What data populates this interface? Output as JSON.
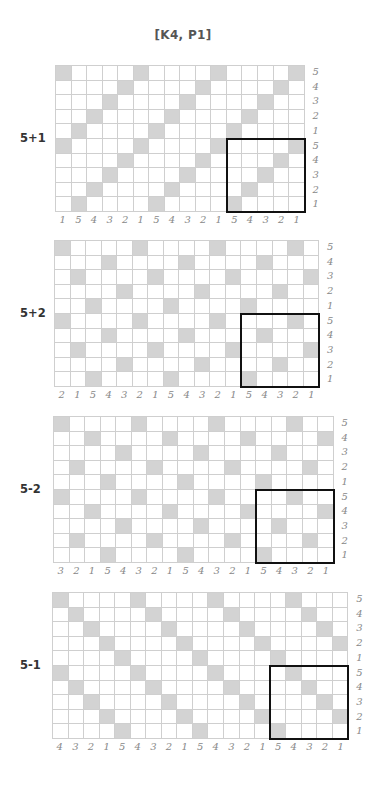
{
  "title": "[K4, P1]",
  "colors": {
    "shaded": "#d3d3d3",
    "grid_line": "#cfcfcf",
    "highlight_box": "#111111",
    "axis_label": "#888888"
  },
  "charts": [
    {
      "label": "5+1",
      "columns": 16,
      "rows": 10,
      "col_labels": [
        "1",
        "5",
        "4",
        "3",
        "2",
        "1",
        "5",
        "4",
        "3",
        "2",
        "1",
        "5",
        "4",
        "3",
        "2",
        "1"
      ],
      "row_labels": [
        "5",
        "4",
        "3",
        "2",
        "1",
        "5",
        "4",
        "3",
        "2",
        "1"
      ],
      "shaded": [
        [
          0,
          5,
          10,
          15
        ],
        [
          4,
          9,
          14
        ],
        [
          3,
          8,
          13
        ],
        [
          2,
          7,
          12
        ],
        [
          1,
          6,
          11
        ],
        [
          0,
          5,
          10,
          15
        ],
        [
          4,
          9,
          14
        ],
        [
          3,
          8,
          13
        ],
        [
          2,
          7,
          12
        ],
        [
          1,
          6,
          11
        ]
      ],
      "box": {
        "col_start": 11,
        "col_end": 15,
        "row_start": 5,
        "row_end": 9
      }
    },
    {
      "label": "5+2",
      "columns": 17,
      "rows": 10,
      "col_labels": [
        "2",
        "1",
        "5",
        "4",
        "3",
        "2",
        "1",
        "5",
        "4",
        "3",
        "2",
        "1",
        "5",
        "4",
        "3",
        "2",
        "1"
      ],
      "row_labels": [
        "5",
        "4",
        "3",
        "2",
        "1",
        "5",
        "4",
        "3",
        "2",
        "1"
      ],
      "shaded": [
        [
          0,
          5,
          10,
          15
        ],
        [
          3,
          8,
          13
        ],
        [
          1,
          6,
          11,
          16
        ],
        [
          4,
          9,
          14
        ],
        [
          2,
          7,
          12
        ],
        [
          0,
          5,
          10,
          15
        ],
        [
          3,
          8,
          13
        ],
        [
          1,
          6,
          11,
          16
        ],
        [
          4,
          9,
          14
        ],
        [
          2,
          7,
          12
        ]
      ],
      "box": {
        "col_start": 12,
        "col_end": 16,
        "row_start": 5,
        "row_end": 9
      }
    },
    {
      "label": "5-2",
      "columns": 18,
      "rows": 10,
      "col_labels": [
        "3",
        "2",
        "1",
        "5",
        "4",
        "3",
        "2",
        "1",
        "5",
        "4",
        "3",
        "2",
        "1",
        "5",
        "4",
        "3",
        "2",
        "1"
      ],
      "row_labels": [
        "5",
        "4",
        "3",
        "2",
        "1",
        "5",
        "4",
        "3",
        "2",
        "1"
      ],
      "shaded": [
        [
          0,
          5,
          10,
          15
        ],
        [
          2,
          7,
          12,
          17
        ],
        [
          4,
          9,
          14
        ],
        [
          1,
          6,
          11,
          16
        ],
        [
          3,
          8,
          13
        ],
        [
          0,
          5,
          10,
          15
        ],
        [
          2,
          7,
          12,
          17
        ],
        [
          4,
          9,
          14
        ],
        [
          1,
          6,
          11,
          16
        ],
        [
          3,
          8,
          13
        ]
      ],
      "box": {
        "col_start": 13,
        "col_end": 17,
        "row_start": 5,
        "row_end": 9
      }
    },
    {
      "label": "5-1",
      "columns": 19,
      "rows": 10,
      "col_labels": [
        "4",
        "3",
        "2",
        "1",
        "5",
        "4",
        "3",
        "2",
        "1",
        "5",
        "4",
        "3",
        "2",
        "1",
        "5",
        "4",
        "3",
        "2",
        "1"
      ],
      "row_labels": [
        "5",
        "4",
        "3",
        "2",
        "1",
        "5",
        "4",
        "3",
        "2",
        "1"
      ],
      "shaded": [
        [
          0,
          5,
          10,
          15
        ],
        [
          1,
          6,
          11,
          16
        ],
        [
          2,
          7,
          12,
          17
        ],
        [
          3,
          8,
          13,
          18
        ],
        [
          4,
          9,
          14
        ],
        [
          0,
          5,
          10,
          15
        ],
        [
          1,
          6,
          11,
          16
        ],
        [
          2,
          7,
          12,
          17
        ],
        [
          3,
          8,
          13,
          18
        ],
        [
          4,
          9,
          14
        ]
      ],
      "box": {
        "col_start": 14,
        "col_end": 18,
        "row_start": 5,
        "row_end": 9
      }
    }
  ]
}
